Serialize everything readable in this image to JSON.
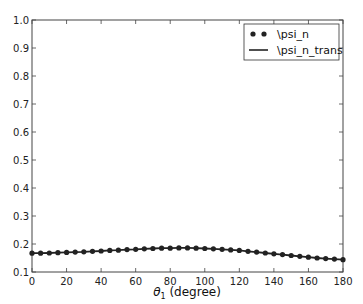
{
  "chart_data": {
    "type": "line",
    "title": "",
    "xlabel": "θ1 (degree)",
    "xlabel_main": "θ",
    "xlabel_sub": "1",
    "xlabel_rest": " (degree)",
    "ylabel": "",
    "xlim": [
      0,
      180
    ],
    "ylim": [
      0.1,
      1.0
    ],
    "xticks": [
      0,
      20,
      40,
      60,
      80,
      100,
      120,
      140,
      160,
      180
    ],
    "yticks": [
      0.1,
      0.2,
      0.3,
      0.4,
      0.5,
      0.6,
      0.7,
      0.8,
      0.9,
      1.0
    ],
    "ytick_labels": [
      "0.1",
      "0.2",
      "0.3",
      "0.4",
      "0.5",
      "0.6",
      "0.7",
      "0.8",
      "0.9",
      "1.0"
    ],
    "grid": false,
    "legend_position": "upper right",
    "x": [
      0,
      5,
      10,
      15,
      20,
      25,
      30,
      35,
      40,
      45,
      50,
      55,
      60,
      65,
      70,
      75,
      80,
      85,
      90,
      95,
      100,
      105,
      110,
      115,
      120,
      125,
      130,
      135,
      140,
      145,
      150,
      155,
      160,
      165,
      170,
      175,
      180
    ],
    "series": [
      {
        "name": "\\psi_n",
        "style": "markers",
        "color": "#222222",
        "values": [
          0.167,
          0.167,
          0.168,
          0.169,
          0.17,
          0.171,
          0.172,
          0.174,
          0.175,
          0.177,
          0.178,
          0.18,
          0.181,
          0.183,
          0.184,
          0.185,
          0.185,
          0.186,
          0.186,
          0.185,
          0.184,
          0.183,
          0.181,
          0.179,
          0.177,
          0.174,
          0.171,
          0.168,
          0.165,
          0.162,
          0.159,
          0.156,
          0.153,
          0.15,
          0.148,
          0.146,
          0.144
        ]
      },
      {
        "name": "\\psi_n_trans",
        "style": "line",
        "color": "#222222",
        "values": [
          0.167,
          0.167,
          0.168,
          0.169,
          0.17,
          0.171,
          0.172,
          0.174,
          0.175,
          0.177,
          0.178,
          0.18,
          0.181,
          0.183,
          0.184,
          0.185,
          0.185,
          0.186,
          0.186,
          0.185,
          0.184,
          0.183,
          0.181,
          0.179,
          0.177,
          0.174,
          0.171,
          0.168,
          0.165,
          0.162,
          0.159,
          0.156,
          0.153,
          0.15,
          0.148,
          0.146,
          0.144
        ]
      }
    ]
  },
  "legend": {
    "items": [
      {
        "label": "\\psi_n",
        "style": "markers"
      },
      {
        "label": "\\psi_n_trans",
        "style": "line"
      }
    ]
  }
}
